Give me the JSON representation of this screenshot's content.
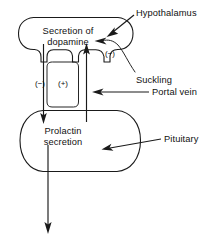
{
  "figure": {
    "type": "biology-flow-diagram",
    "background_color": "#ffffff",
    "line_color": "#1a1a1a"
  },
  "nodes": {
    "hypothalamus_box": {
      "text_line1": "Secretion of",
      "text_line2": "dopamine"
    },
    "pituitary_box": {
      "text_line1": "Prolactin",
      "text_line2": "secretion"
    }
  },
  "signs": {
    "inhibition_left": "(−)",
    "stimulation_middle": "(+)",
    "inhibition_suckling": "(−)"
  },
  "annotations": {
    "hypothalamus": "Hypothalamus",
    "suckling": "Suckling",
    "portal_vein": "Portal vein",
    "pituitary": "Pituitary"
  },
  "arrows": [
    {
      "name": "dopamine-to-prolactin",
      "direction": "down",
      "sign": "(−)",
      "from": "Secretion of dopamine",
      "to": "Prolactin secretion"
    },
    {
      "name": "prolactin-feedback-up",
      "direction": "up",
      "sign": "(+)",
      "from": "Prolactin secretion",
      "to": "Secretion of dopamine"
    },
    {
      "name": "prolactin-output",
      "direction": "down",
      "from": "Prolactin secretion",
      "to": "circulation"
    },
    {
      "name": "suckling-to-dopamine",
      "direction": "left",
      "sign": "(−)",
      "from": "Suckling",
      "to": "Secretion of dopamine"
    },
    {
      "name": "hypothalamus-pointer",
      "direction": "left",
      "from": "Hypothalamus label",
      "to": "hypothalamus outline"
    },
    {
      "name": "portal-vein-pointer",
      "direction": "left",
      "from": "Portal vein label",
      "to": "pituitary stalk"
    },
    {
      "name": "pituitary-pointer",
      "direction": "left",
      "from": "Pituitary label",
      "to": "pituitary outline"
    }
  ]
}
